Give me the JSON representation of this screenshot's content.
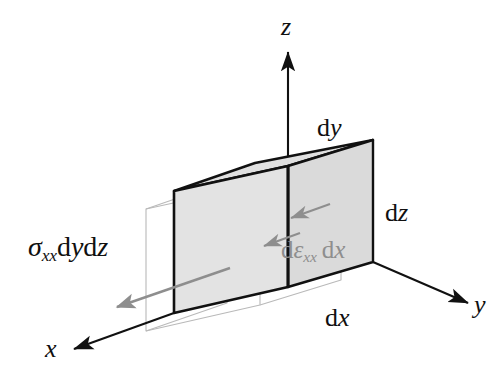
{
  "figure": {
    "kind": "3d-stress-element-diagram",
    "background_color": "#ffffff"
  },
  "colors": {
    "face_fill": "#e3e3e3",
    "top_face_fill": "#e0e0e0",
    "right_face_fill": "#dadada",
    "edge_stroke": "#111111",
    "ghost_stroke": "#b9b9b9",
    "gray_accent": "#8e8e8e",
    "text": "#101010"
  },
  "axes": [
    {
      "name": "z-axis",
      "label_roman": "",
      "label_italic": "z",
      "direction": "up"
    },
    {
      "name": "y-axis",
      "label_roman": "",
      "label_italic": "y",
      "direction": "right"
    },
    {
      "name": "x-axis",
      "label_roman": "",
      "label_italic": "x",
      "direction": "down-left"
    }
  ],
  "dimension_labels": [
    {
      "name": "dy-label",
      "roman": "d",
      "italic": "y"
    },
    {
      "name": "dz-label",
      "roman": "d",
      "italic": "z"
    },
    {
      "name": "dx-label",
      "roman": "d",
      "italic": "x"
    }
  ],
  "annotations": {
    "stress": {
      "name": "stress-force-label",
      "sigma": "σ",
      "sigma_sub": "xx",
      "d1": "d",
      "var1": "y",
      "d2": "d",
      "var2": "z",
      "color": "#101010"
    },
    "strain": {
      "name": "strain-elongation-label",
      "d0": "d",
      "epsilon": "ε",
      "epsilon_sub": "xx",
      "d1": "d",
      "var1": "x",
      "color": "#8e8e8e"
    }
  },
  "geometry": {
    "cube": {
      "front_top_left": [
        174,
        191
      ],
      "front_top_right": [
        288,
        166
      ],
      "back_top_right": [
        373,
        140
      ],
      "back_top_left": [
        255,
        163
      ],
      "front_bottom_left": [
        174,
        313
      ],
      "front_bottom_right": [
        288,
        287
      ],
      "back_bottom_right": [
        373,
        262
      ]
    },
    "ghost_offset": [
      -28,
      18
    ]
  }
}
